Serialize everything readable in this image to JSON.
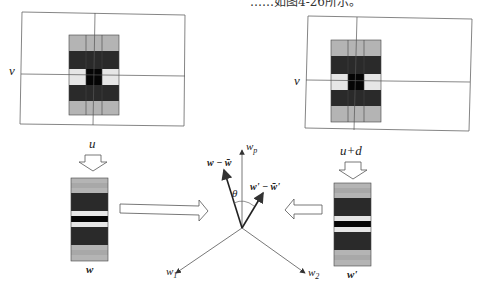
{
  "caption_fragment": "……如图4-26所示。",
  "left_frame": {
    "row_label": "v",
    "col_label": "u",
    "vector_label": "w"
  },
  "right_frame": {
    "row_label": "v",
    "col_label": "u+d",
    "vector_label": "w'"
  },
  "vector_space": {
    "axes": [
      "w1",
      "w2",
      "wp"
    ],
    "axis_labels": {
      "w1": "w",
      "w1_sub": "1",
      "w2": "w",
      "w2_sub": "2",
      "wp": "w",
      "wp_sub": "p"
    },
    "vector_a": "w − w̄",
    "vector_b": "w' − w̄'",
    "angle_label": "θ"
  },
  "colors": {
    "light_gray": "#b4b4b4",
    "dark_gray": "#2a2a2a",
    "very_light": "#e6e6e6",
    "black": "#050505",
    "line": "#555555"
  }
}
